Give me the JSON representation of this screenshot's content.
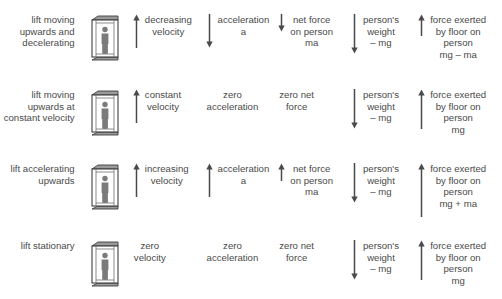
{
  "diagram": {
    "text_color": "#4a4a4a",
    "arrow_color": "#4a4a4a",
    "background": "#ffffff",
    "lift_icon_name": "lift-with-person-icon",
    "rows": [
      {
        "id": "row-decelerating",
        "description": "lift moving\nupwards and\ndecelerating",
        "velocity": {
          "label": "decreasing\nvelocity",
          "arrow": "up",
          "arrow_length": 34
        },
        "acceleration": {
          "label": "acceleration\na",
          "arrow": "down",
          "arrow_length": 34
        },
        "net_force": {
          "label": "net force\non person\nma",
          "arrow": "down",
          "arrow_length": 18
        },
        "weight": {
          "label": "person's\nweight\n– mg",
          "arrow": "down",
          "arrow_length": 40
        },
        "floor_force": {
          "label": "force exerted\nby floor on\nperson\nmg – ma",
          "arrow": "up",
          "arrow_length": 22
        }
      },
      {
        "id": "row-constant-velocity",
        "description": "lift moving\nupwards at\nconstant\nvelocity",
        "velocity": {
          "label": "constant\nvelocity",
          "arrow": "up",
          "arrow_length": 34
        },
        "acceleration": {
          "label": "zero\nacceleration",
          "arrow": "none",
          "arrow_length": 0
        },
        "net_force": {
          "label": "zero net\nforce",
          "arrow": "none",
          "arrow_length": 0
        },
        "weight": {
          "label": "person's\nweight\n– mg",
          "arrow": "down",
          "arrow_length": 40
        },
        "floor_force": {
          "label": "force exerted\nby floor on\nperson\nmg",
          "arrow": "up",
          "arrow_length": 40
        }
      },
      {
        "id": "row-accelerating",
        "description": "lift\naccelerating\nupwards",
        "velocity": {
          "label": "increasing\nvelocity",
          "arrow": "up",
          "arrow_length": 34
        },
        "acceleration": {
          "label": "acceleration\na",
          "arrow": "up",
          "arrow_length": 34
        },
        "net_force": {
          "label": "net force\non person\nma",
          "arrow": "up",
          "arrow_length": 18
        },
        "weight": {
          "label": "person's\nweight\n– mg",
          "arrow": "down",
          "arrow_length": 40
        },
        "floor_force": {
          "label": "force exerted\nby floor on\nperson\nmg + ma",
          "arrow": "up",
          "arrow_length": 54
        }
      },
      {
        "id": "row-stationary",
        "description": "lift\nstationary",
        "velocity": {
          "label": "zero\nvelocity",
          "arrow": "none",
          "arrow_length": 0
        },
        "acceleration": {
          "label": "zero\nacceleration",
          "arrow": "none",
          "arrow_length": 0
        },
        "net_force": {
          "label": "zero net\nforce",
          "arrow": "none",
          "arrow_length": 0
        },
        "weight": {
          "label": "person's\nweight\n– mg",
          "arrow": "down",
          "arrow_length": 40
        },
        "floor_force": {
          "label": "force exerted\nby floor on\nperson\nmg",
          "arrow": "up",
          "arrow_length": 40
        }
      }
    ]
  }
}
